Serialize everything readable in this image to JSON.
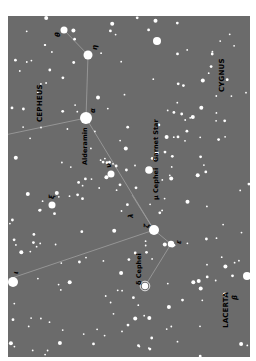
{
  "map": {
    "background": "#6b6b6b",
    "star_color": "#ffffff",
    "line_color": "#9a9a9a",
    "label_color": "#000000",
    "orientation": "rotated 90 degrees counter-clockwise",
    "constellations": [
      {
        "name": "CEPHEUS",
        "x": 40,
        "y": 122
      },
      {
        "name": "CYGNUS",
        "x": 222,
        "y": 92
      },
      {
        "name": "LACERTA",
        "x": 226,
        "y": 328
      }
    ],
    "star_labels": [
      {
        "name": "Alderamin",
        "x": 85,
        "y": 165
      },
      {
        "name": "Garnet Star",
        "x": 156,
        "y": 162
      },
      {
        "name": "μ Cephei",
        "x": 156,
        "y": 200
      },
      {
        "name": "δ Cephei",
        "x": 139,
        "y": 285
      }
    ],
    "greek_labels": [
      {
        "text": "θ",
        "x": 58,
        "y": 37
      },
      {
        "text": "η",
        "x": 95,
        "y": 50
      },
      {
        "text": "α",
        "x": 93,
        "y": 113
      },
      {
        "text": "ν",
        "x": 109,
        "y": 168
      },
      {
        "text": "ξ",
        "x": 52,
        "y": 199
      },
      {
        "text": "ζ",
        "x": 147,
        "y": 228
      },
      {
        "text": "λ",
        "x": 131,
        "y": 218
      },
      {
        "text": "ι",
        "x": 16,
        "y": 274
      },
      {
        "text": "β",
        "x": 235,
        "y": 300
      },
      {
        "text": "ε",
        "x": 179,
        "y": 244
      }
    ],
    "bright_stars": [
      {
        "id": "theta",
        "x": 64,
        "y": 30,
        "r": 3.5
      },
      {
        "id": "eta",
        "x": 88,
        "y": 55,
        "r": 4.5
      },
      {
        "id": "alpha",
        "x": 86,
        "y": 118,
        "r": 6
      },
      {
        "id": "garnet",
        "x": 149,
        "y": 170,
        "r": 3.8
      },
      {
        "id": "zeta",
        "x": 154,
        "y": 230,
        "r": 5
      },
      {
        "id": "epsilon",
        "x": 171,
        "y": 244,
        "r": 3.2
      },
      {
        "id": "delta",
        "x": 145,
        "y": 286,
        "r": 3.2
      },
      {
        "id": "iota",
        "x": 13,
        "y": 282,
        "r": 5
      },
      {
        "id": "beta_lac",
        "x": 247,
        "y": 276,
        "r": 4
      },
      {
        "id": "xi",
        "x": 52,
        "y": 205,
        "r": 3.5
      },
      {
        "id": "nu",
        "x": 111,
        "y": 174,
        "r": 3.5
      },
      {
        "id": "cyg1",
        "x": 157,
        "y": 41,
        "r": 4
      }
    ],
    "lines": [
      [
        64,
        30,
        88,
        55
      ],
      [
        88,
        55,
        86,
        118
      ],
      [
        86,
        118,
        0,
        136
      ],
      [
        86,
        118,
        154,
        230
      ],
      [
        154,
        230,
        171,
        244
      ],
      [
        154,
        230,
        0,
        282
      ],
      [
        171,
        244,
        145,
        286
      ],
      [
        154,
        230,
        132,
        195
      ]
    ]
  }
}
